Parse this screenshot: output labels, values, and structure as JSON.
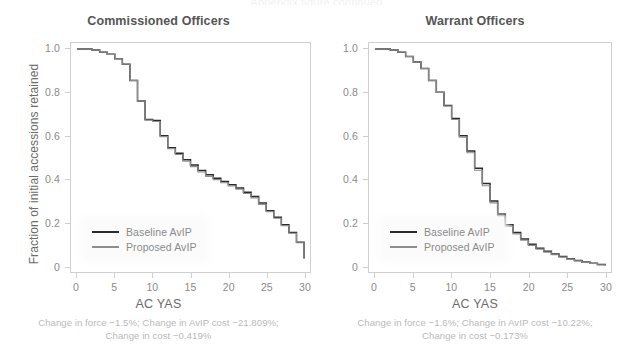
{
  "figure": {
    "cut_off_header": "Appendix figure continued",
    "y_axis_label": "Fraction of initial accessions retained",
    "x_axis_label": "AC YAS",
    "legend": [
      {
        "key": "baseline",
        "label": "Baseline AvIP",
        "color": "#2b2b2b"
      },
      {
        "key": "proposed",
        "label": "Proposed AvIP",
        "color": "#8d8d8d"
      }
    ],
    "colors": {
      "baseline": "#2b2b2b",
      "proposed": "#8d8d8d",
      "axis": "#cfcfcf",
      "tick_text": "#8a8a8a",
      "title_text": "#555555",
      "caption_text": "#b9b9b9"
    }
  },
  "panels": [
    {
      "id": "commissioned-officers",
      "title": "Commissioned Officers",
      "x_axis_label": "AC YAS",
      "caption_line1": "Change in force −1.5%; Change in AvIP cost −21.809%;",
      "caption_line2": "Change in cost −0.419%",
      "metrics": {
        "change_in_force": "−1.5%",
        "change_in_avip_cost": "−21.809%",
        "change_in_cost": "−0.419%"
      }
    },
    {
      "id": "warrant-officers",
      "title": "Warrant Officers",
      "x_axis_label": "AC YAS",
      "caption_line1": "Change in force −1.6%; Change in AvIP cost −10.22%;",
      "caption_line2": "Change in cost −0.173%",
      "metrics": {
        "change_in_force": "−1.6%",
        "change_in_avip_cost": "−10.22%",
        "change_in_cost": "−0.173%"
      }
    }
  ],
  "chart_data": {
    "type": "line",
    "xlabel": "AC YAS",
    "ylabel": "Fraction of initial accessions retained",
    "xlim": [
      0,
      30
    ],
    "ylim": [
      0,
      1.0
    ],
    "xticks": [
      0,
      5,
      10,
      15,
      20,
      25,
      30
    ],
    "xtick_labels": [
      "0",
      "5",
      "10",
      "15",
      "20",
      "25",
      "30"
    ],
    "yticks": [
      0,
      0.2,
      0.4,
      0.6,
      0.8,
      1.0
    ],
    "ytick_labels": [
      "0",
      "0.2",
      "0.4",
      "0.6",
      "0.8",
      "1.0"
    ],
    "grid": false,
    "legend_position": "bottom-left",
    "step_style": "post",
    "panels": [
      {
        "id": "commissioned-officers",
        "title": "Commissioned Officers",
        "x": [
          0,
          1,
          2,
          3,
          4,
          5,
          6,
          7,
          8,
          9,
          10,
          11,
          12,
          13,
          14,
          15,
          16,
          17,
          18,
          19,
          20,
          21,
          22,
          23,
          24,
          25,
          26,
          27,
          28,
          29,
          30
        ],
        "series": [
          {
            "name": "Baseline AvIP",
            "color": "#2b2b2b",
            "values": [
              1.0,
              1.0,
              0.995,
              0.985,
              0.975,
              0.955,
              0.93,
              0.855,
              0.76,
              0.675,
              0.67,
              0.6,
              0.545,
              0.52,
              0.49,
              0.465,
              0.44,
              0.42,
              0.405,
              0.39,
              0.375,
              0.36,
              0.34,
              0.32,
              0.29,
              0.255,
              0.225,
              0.19,
              0.155,
              0.11,
              0.035
            ]
          },
          {
            "name": "Proposed AvIP",
            "color": "#8d8d8d",
            "values": [
              1.0,
              1.0,
              0.995,
              0.985,
              0.975,
              0.955,
              0.93,
              0.855,
              0.76,
              0.672,
              0.666,
              0.596,
              0.54,
              0.514,
              0.483,
              0.458,
              0.433,
              0.413,
              0.398,
              0.384,
              0.369,
              0.354,
              0.334,
              0.314,
              0.284,
              0.25,
              0.22,
              0.186,
              0.151,
              0.107,
              0.034
            ]
          }
        ]
      },
      {
        "id": "warrant-officers",
        "title": "Warrant Officers",
        "x": [
          0,
          1,
          2,
          3,
          4,
          5,
          6,
          7,
          8,
          9,
          10,
          11,
          12,
          13,
          14,
          15,
          16,
          17,
          18,
          19,
          20,
          21,
          22,
          23,
          24,
          25,
          26,
          27,
          28,
          29,
          30
        ],
        "series": [
          {
            "name": "Baseline AvIP",
            "color": "#2b2b2b",
            "values": [
              1.0,
              1.0,
              0.995,
              0.985,
              0.965,
              0.94,
              0.91,
              0.855,
              0.8,
              0.74,
              0.68,
              0.6,
              0.53,
              0.45,
              0.38,
              0.3,
              0.24,
              0.19,
              0.155,
              0.125,
              0.1,
              0.082,
              0.068,
              0.055,
              0.044,
              0.034,
              0.026,
              0.019,
              0.013,
              0.007,
              0.002
            ]
          },
          {
            "name": "Proposed AvIP",
            "color": "#8d8d8d",
            "values": [
              1.0,
              1.0,
              0.995,
              0.985,
              0.965,
              0.94,
              0.91,
              0.855,
              0.8,
              0.737,
              0.675,
              0.594,
              0.522,
              0.441,
              0.37,
              0.291,
              0.232,
              0.183,
              0.148,
              0.119,
              0.095,
              0.078,
              0.064,
              0.052,
              0.041,
              0.032,
              0.024,
              0.018,
              0.012,
              0.006,
              0.002
            ]
          }
        ]
      }
    ]
  }
}
